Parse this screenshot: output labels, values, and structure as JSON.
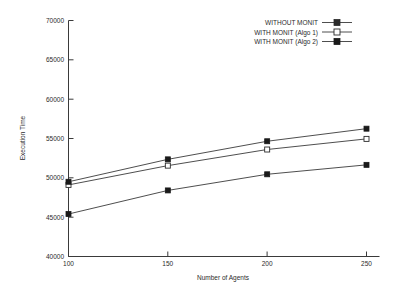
{
  "chart_data": {
    "type": "line",
    "title": "",
    "xlabel": "Number of Agents",
    "ylabel": "Execution Time",
    "x": [
      100,
      150,
      200,
      250
    ],
    "xtick_labels": [
      "100",
      "150",
      "200",
      "250"
    ],
    "ytick_labels": [
      "40000",
      "45000",
      "50000",
      "55000",
      "60000",
      "65000",
      "70000"
    ],
    "yticks": [
      40000,
      45000,
      50000,
      55000,
      60000,
      65000,
      70000
    ],
    "xlim": [
      100,
      250
    ],
    "ylim": [
      40000,
      70000
    ],
    "grid": false,
    "legend_position": "top-right",
    "series": [
      {
        "name": "WITHOUT MONIT",
        "marker": "filled-square",
        "values": [
          45400,
          48400,
          50450,
          51650
        ]
      },
      {
        "name": "WITH MONIT (Algo 1)",
        "marker": "open-square",
        "values": [
          49100,
          51550,
          53600,
          54950
        ]
      },
      {
        "name": "WITH MONIT (Algo 2)",
        "marker": "filled-square",
        "values": [
          49500,
          52350,
          54650,
          56250
        ]
      }
    ],
    "colors": {
      "line": "#3a3a3a",
      "axis": "#3a3a3a",
      "text": "#2b2b2b",
      "background": "#ffffff"
    }
  },
  "labels": {
    "ytick_0": "40000",
    "ytick_1": "45000",
    "ytick_2": "50000",
    "ytick_3": "55000",
    "ytick_4": "60000",
    "ytick_5": "65000",
    "ytick_6": "70000",
    "xtick_0": "100",
    "xtick_1": "150",
    "xtick_2": "200",
    "xtick_3": "250",
    "x_axis_title": "Number of Agents",
    "y_axis_title": "Execution Time",
    "legend_0": "WITHOUT MONIT",
    "legend_1": "WITH MONIT (Algo 1)",
    "legend_2": "WITH MONIT (Algo 2)"
  }
}
